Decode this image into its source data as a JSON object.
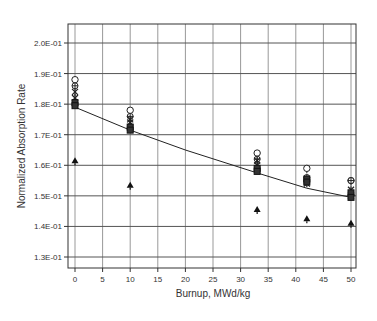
{
  "chart_data": {
    "type": "scatter",
    "title": "",
    "xlabel": "Burnup, MWd/kg",
    "ylabel": "Normalized Absorption Rate",
    "xlim": [
      -1,
      51
    ],
    "ylim": [
      0.1265,
      0.2065
    ],
    "grid": true,
    "legend": "none",
    "x_ticks": [
      0,
      5,
      10,
      15,
      20,
      25,
      30,
      35,
      40,
      45,
      50
    ],
    "x_tick_labels": [
      "0",
      "5",
      "10",
      "15",
      "20",
      "25",
      "30",
      "35",
      "40",
      "45",
      "50"
    ],
    "y_ticks": [
      0.13,
      0.14,
      0.15,
      0.16,
      0.17,
      0.18,
      0.19,
      0.2
    ],
    "y_tick_labels": [
      "1.3E-01",
      "1.4E-01",
      "1.5E-01",
      "1.6E-01",
      "1.7E-01",
      "1.8E-01",
      "1.9E-01",
      "2.0E-01"
    ],
    "x": [
      0,
      10,
      33,
      42,
      50
    ],
    "series": [
      {
        "name": "open-circle",
        "marker": "circle",
        "values": [
          0.188,
          0.178,
          0.164,
          0.159,
          0.155
        ]
      },
      {
        "name": "circle-cross",
        "marker": "circle-plus",
        "values": [
          0.186,
          0.176,
          0.162,
          0.156,
          0.155
        ]
      },
      {
        "name": "star-upper",
        "marker": "star",
        "values": [
          0.184,
          0.175,
          0.1615,
          0.155,
          0.152
        ]
      },
      {
        "name": "star-lower",
        "marker": "star",
        "values": [
          0.182,
          0.174,
          0.16,
          0.154,
          0.15
        ]
      },
      {
        "name": "square-upper",
        "marker": "square",
        "values": [
          0.1805,
          0.1725,
          0.159,
          0.1555,
          0.151
        ]
      },
      {
        "name": "square-lower",
        "marker": "square",
        "values": [
          0.1795,
          0.1715,
          0.158,
          0.1545,
          0.1495
        ]
      },
      {
        "name": "triangle",
        "marker": "triangle",
        "values": [
          0.1615,
          0.1535,
          0.1455,
          0.1425,
          0.141
        ]
      }
    ],
    "fit_line": {
      "name": "reference curve",
      "x": [
        0,
        10,
        20,
        33,
        42,
        50
      ],
      "values": [
        0.179,
        0.1715,
        0.165,
        0.1575,
        0.1525,
        0.1495
      ]
    }
  }
}
